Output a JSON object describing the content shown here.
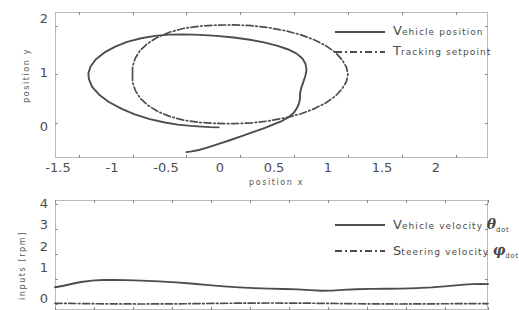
{
  "figure": {
    "background_color": "#ffffff",
    "line_color": "#4d4d4d",
    "frame_color": "#b9b9b9"
  },
  "chart_data": [
    {
      "type": "line",
      "name": "position-plot",
      "title": "",
      "xlabel": "position x",
      "ylabel": "position y",
      "xlim": [
        -1.72,
        2.3
      ],
      "ylim": [
        -0.72,
        2.28
      ],
      "xticks": [
        -1.5,
        -1,
        -0.5,
        0,
        0.5,
        1,
        1.5,
        2
      ],
      "xticklabels": [
        "-1.5",
        "-1",
        "-0.5",
        "0",
        "0.5",
        "1",
        "1.5",
        "2"
      ],
      "yticks": [
        0,
        1,
        2
      ],
      "yticklabels": [
        "0",
        "1",
        "2"
      ],
      "grid": false,
      "legend_position": "upper right",
      "series": [
        {
          "name": "Vehicle position",
          "style": "solid",
          "points": [
            [
              -0.2,
              -0.09
            ],
            [
              -0.28,
              -0.085
            ],
            [
              -0.36,
              -0.075
            ],
            [
              -0.46,
              -0.06
            ],
            [
              -0.58,
              -0.035
            ],
            [
              -0.7,
              0.01
            ],
            [
              -0.84,
              0.08
            ],
            [
              -0.98,
              0.175
            ],
            [
              -1.1,
              0.29
            ],
            [
              -1.22,
              0.43
            ],
            [
              -1.31,
              0.58
            ],
            [
              -1.375,
              0.74
            ],
            [
              -1.405,
              0.9
            ],
            [
              -1.41,
              1.02
            ],
            [
              -1.39,
              1.16
            ],
            [
              -1.34,
              1.31
            ],
            [
              -1.26,
              1.45
            ],
            [
              -1.16,
              1.57
            ],
            [
              -1.05,
              1.665
            ],
            [
              -0.92,
              1.74
            ],
            [
              -0.79,
              1.79
            ],
            [
              -0.66,
              1.815
            ],
            [
              -0.52,
              1.82
            ],
            [
              -0.37,
              1.81
            ],
            [
              -0.22,
              1.79
            ],
            [
              -0.06,
              1.755
            ],
            [
              0.09,
              1.71
            ],
            [
              0.22,
              1.655
            ],
            [
              0.34,
              1.59
            ],
            [
              0.44,
              1.515
            ],
            [
              0.52,
              1.43
            ],
            [
              0.575,
              1.33
            ],
            [
              0.605,
              1.22
            ],
            [
              0.615,
              1.1
            ],
            [
              0.605,
              0.97
            ],
            [
              0.585,
              0.84
            ],
            [
              0.565,
              0.71
            ],
            [
              0.555,
              0.6
            ],
            [
              0.555,
              0.5
            ],
            [
              0.545,
              0.4
            ],
            [
              0.525,
              0.3
            ],
            [
              0.495,
              0.205
            ],
            [
              0.45,
              0.12
            ],
            [
              0.39,
              0.045
            ],
            [
              0.315,
              -0.025
            ],
            [
              0.23,
              -0.1
            ],
            [
              0.13,
              -0.18
            ],
            [
              0.02,
              -0.265
            ],
            [
              -0.09,
              -0.35
            ],
            [
              -0.2,
              -0.43
            ],
            [
              -0.3,
              -0.5
            ],
            [
              -0.385,
              -0.555
            ],
            [
              -0.45,
              -0.585
            ],
            [
              -0.5,
              -0.6
            ]
          ]
        },
        {
          "name": "Tracking setpoint",
          "style": "dashdot",
          "points": [
            [
              -1.0,
              1.0
            ],
            [
              -1.0,
              1.16
            ],
            [
              -0.975,
              1.33
            ],
            [
              -0.93,
              1.49
            ],
            [
              -0.86,
              1.635
            ],
            [
              -0.765,
              1.765
            ],
            [
              -0.65,
              1.87
            ],
            [
              -0.52,
              1.945
            ],
            [
              -0.375,
              1.99
            ],
            [
              -0.22,
              2.01
            ],
            [
              -0.06,
              2.015
            ],
            [
              0.1,
              2.0
            ],
            [
              0.26,
              1.96
            ],
            [
              0.42,
              1.895
            ],
            [
              0.565,
              1.81
            ],
            [
              0.69,
              1.705
            ],
            [
              0.8,
              1.58
            ],
            [
              0.885,
              1.445
            ],
            [
              0.945,
              1.3
            ],
            [
              0.985,
              1.15
            ],
            [
              1.0,
              1.0
            ],
            [
              0.985,
              0.85
            ],
            [
              0.945,
              0.7
            ],
            [
              0.885,
              0.555
            ],
            [
              0.8,
              0.42
            ],
            [
              0.69,
              0.295
            ],
            [
              0.565,
              0.19
            ],
            [
              0.42,
              0.105
            ],
            [
              0.26,
              0.04
            ],
            [
              0.1,
              0.0
            ],
            [
              -0.06,
              -0.015
            ],
            [
              -0.22,
              -0.01
            ],
            [
              -0.375,
              0.01
            ],
            [
              -0.52,
              0.055
            ],
            [
              -0.65,
              0.13
            ],
            [
              -0.765,
              0.235
            ],
            [
              -0.86,
              0.365
            ],
            [
              -0.93,
              0.51
            ],
            [
              -0.975,
              0.67
            ],
            [
              -1.0,
              0.84
            ],
            [
              -1.0,
              1.0
            ]
          ]
        }
      ]
    },
    {
      "type": "line",
      "name": "inputs-plot",
      "title": "",
      "xlabel": "",
      "ylabel": "inputs [rpm]",
      "xlim": [
        0,
        1
      ],
      "ylim": [
        -0.25,
        4.15
      ],
      "yticks": [
        0,
        1,
        2,
        3,
        4
      ],
      "yticklabels": [
        "0",
        "1",
        "2",
        "3",
        "4"
      ],
      "grid": false,
      "legend_position": "upper right",
      "series": [
        {
          "name": "Vehicle velocity",
          "symbol": "theta_dot",
          "style": "solid",
          "points": [
            [
              0.0,
              0.66
            ],
            [
              0.02,
              0.72
            ],
            [
              0.04,
              0.8
            ],
            [
              0.06,
              0.87
            ],
            [
              0.085,
              0.925
            ],
            [
              0.11,
              0.95
            ],
            [
              0.135,
              0.955
            ],
            [
              0.165,
              0.945
            ],
            [
              0.2,
              0.925
            ],
            [
              0.24,
              0.895
            ],
            [
              0.28,
              0.855
            ],
            [
              0.32,
              0.8
            ],
            [
              0.355,
              0.745
            ],
            [
              0.39,
              0.695
            ],
            [
              0.425,
              0.655
            ],
            [
              0.46,
              0.625
            ],
            [
              0.495,
              0.605
            ],
            [
              0.53,
              0.59
            ],
            [
              0.56,
              0.575
            ],
            [
              0.59,
              0.545
            ],
            [
              0.615,
              0.52
            ],
            [
              0.64,
              0.525
            ],
            [
              0.665,
              0.555
            ],
            [
              0.695,
              0.58
            ],
            [
              0.73,
              0.595
            ],
            [
              0.765,
              0.6
            ],
            [
              0.8,
              0.605
            ],
            [
              0.835,
              0.625
            ],
            [
              0.87,
              0.655
            ],
            [
              0.9,
              0.695
            ],
            [
              0.925,
              0.735
            ],
            [
              0.945,
              0.765
            ],
            [
              0.965,
              0.785
            ],
            [
              0.985,
              0.79
            ],
            [
              1.0,
              0.785
            ]
          ]
        },
        {
          "name": "Steering velocity",
          "symbol": "phi_dot",
          "style": "dashdot",
          "points": [
            [
              0.0,
              0.02
            ],
            [
              0.1,
              0.0
            ],
            [
              0.2,
              -0.01
            ],
            [
              0.3,
              0.0
            ],
            [
              0.4,
              0.02
            ],
            [
              0.5,
              0.03
            ],
            [
              0.6,
              0.02
            ],
            [
              0.7,
              0.0
            ],
            [
              0.8,
              -0.01
            ],
            [
              0.9,
              0.0
            ],
            [
              1.0,
              0.01
            ]
          ]
        }
      ]
    }
  ],
  "position_plot": {
    "ylabel": "position y",
    "xlabel": "position x",
    "xticklabels": [
      "-1.5",
      "-1",
      "-0.5",
      "0",
      "0.5",
      "1",
      "1.5",
      "2"
    ],
    "yticklabels": [
      "0",
      "1",
      "2"
    ],
    "legend": [
      {
        "cap": "V",
        "rest": "ehicle position",
        "style": "solid"
      },
      {
        "cap": "T",
        "rest": "racking setpoint",
        "style": "dashdot"
      }
    ]
  },
  "inputs_plot": {
    "ylabel": "inputs [rpm]",
    "yticklabels": [
      "0",
      "1",
      "2",
      "3",
      "4"
    ],
    "legend": [
      {
        "cap": "V",
        "rest": "ehicle velocity",
        "symbol": "θ",
        "sub": "dot",
        "style": "solid"
      },
      {
        "cap": "S",
        "rest": "teering velocity",
        "symbol": "φ",
        "sub": "dot",
        "style": "dashdot"
      }
    ]
  }
}
